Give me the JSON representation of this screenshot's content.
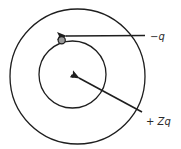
{
  "diagram": {
    "colors": {
      "stroke": "#1e1e1e",
      "electron_fill": "#9a9a9a",
      "background": "#ffffff",
      "text": "#2a2a2a"
    },
    "outer_circle": {
      "cx": 77.5,
      "cy": 76.5,
      "r": 67.5
    },
    "inner_circle": {
      "cx": 72.5,
      "cy": 74.5,
      "r": 33.5
    },
    "nucleus": {
      "cx": 72.7,
      "cy": 76,
      "r": 1.8
    },
    "electron": {
      "cx": 61.7,
      "cy": 40.3,
      "r": 3.6
    },
    "labels": {
      "electron": "−q",
      "nucleus": "+ Zq"
    },
    "arrows": [
      {
        "name": "electron-arrow",
        "from": [
          145,
          35.5
        ],
        "to": [
          66,
          36
        ]
      },
      {
        "name": "nucleus-arrow",
        "from": [
          142,
          112
        ],
        "to": [
          79,
          78
        ]
      }
    ]
  }
}
